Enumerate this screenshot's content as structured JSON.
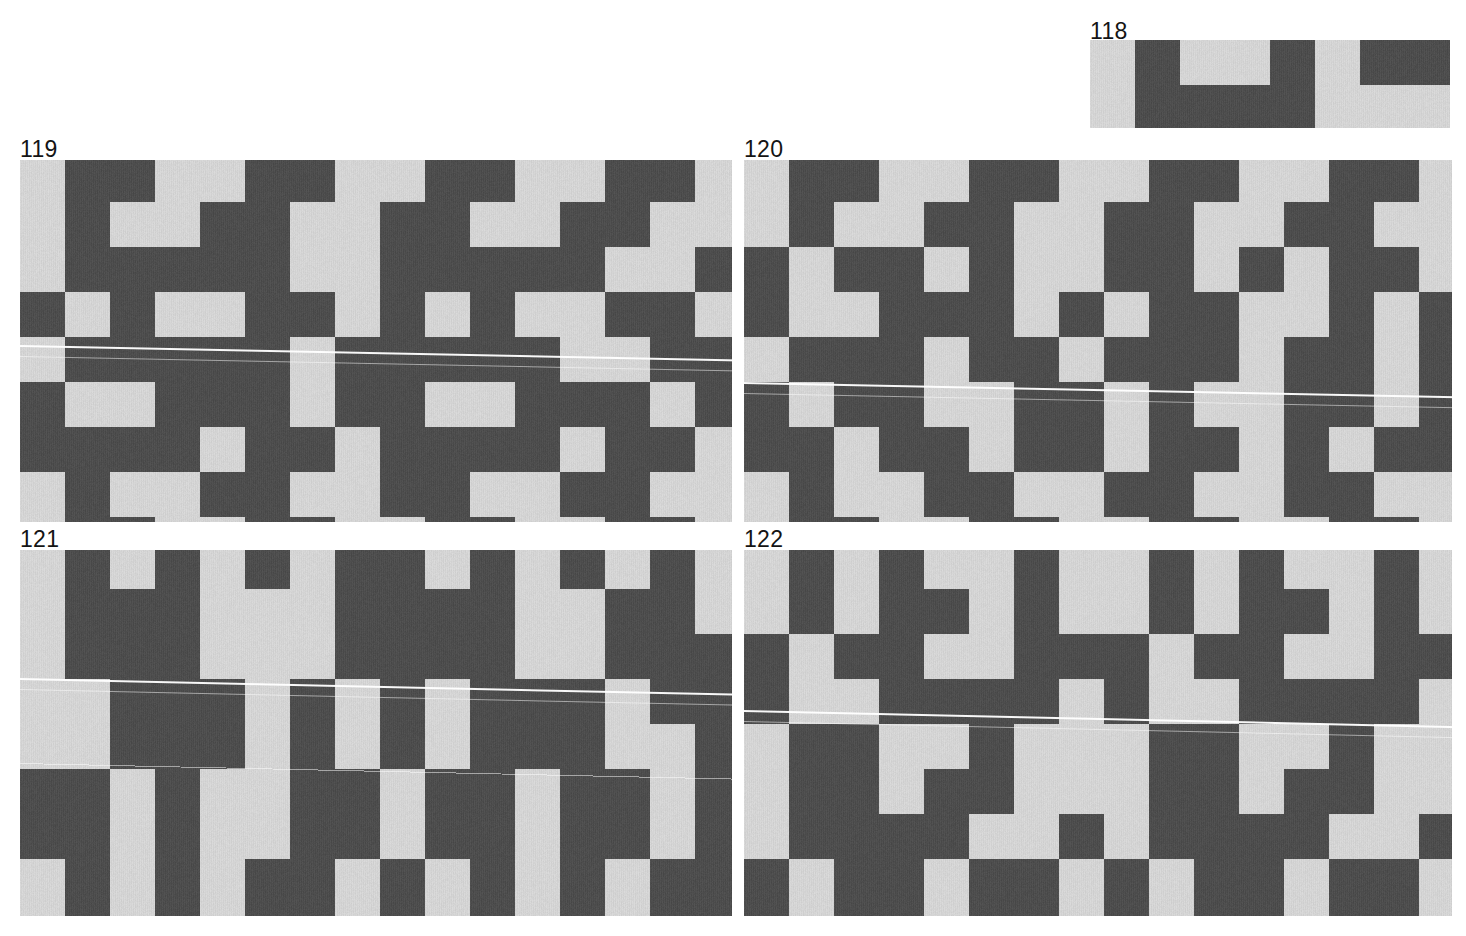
{
  "sheet": {
    "background_color": "#ffffff",
    "width": 1466,
    "height": 936,
    "cell_size": 45,
    "colors": {
      "light": "#d4d4d4",
      "dark": "#4d4d4d",
      "label": "#141414",
      "artifact_line": "#ffffff"
    }
  },
  "plates": [
    {
      "id": "plate-118",
      "number": "118",
      "label_x": 1090,
      "label_y": 20,
      "x": 1090,
      "y": 40,
      "width": 360,
      "height": 88,
      "cols": 8,
      "rows": 2,
      "offset_x": 0,
      "offset_y": 0,
      "scanlines": [],
      "grid": [
        [
          0,
          1,
          0,
          0,
          1,
          0,
          1,
          1
        ],
        [
          0,
          1,
          1,
          1,
          1,
          0,
          0,
          0
        ]
      ]
    },
    {
      "id": "plate-119",
      "number": "119",
      "label_x": 20,
      "label_y": 138,
      "x": 20,
      "y": 160,
      "width": 712,
      "height": 362,
      "cols": 16,
      "rows": 9,
      "offset_x": 0,
      "offset_y": -3,
      "scanlines": [
        {
          "y": 185,
          "angle": 1.15,
          "thin": false
        },
        {
          "y": 196,
          "angle": 1.15,
          "thin": true
        }
      ],
      "grid": [
        [
          0,
          1,
          1,
          0,
          0,
          1,
          1,
          0,
          0,
          1,
          1,
          0,
          0,
          1,
          1,
          0
        ],
        [
          0,
          1,
          0,
          0,
          1,
          1,
          0,
          0,
          1,
          1,
          0,
          0,
          1,
          1,
          0,
          0
        ],
        [
          0,
          1,
          1,
          1,
          1,
          1,
          0,
          0,
          1,
          1,
          1,
          1,
          1,
          0,
          0,
          1
        ],
        [
          1,
          0,
          1,
          0,
          0,
          1,
          1,
          0,
          1,
          0,
          1,
          0,
          0,
          1,
          1,
          0
        ],
        [
          0,
          1,
          1,
          1,
          1,
          1,
          0,
          1,
          1,
          1,
          1,
          1,
          0,
          0,
          1,
          1
        ],
        [
          1,
          0,
          0,
          1,
          1,
          1,
          0,
          1,
          1,
          0,
          0,
          1,
          1,
          1,
          0,
          1
        ],
        [
          1,
          1,
          1,
          1,
          0,
          1,
          1,
          0,
          1,
          1,
          1,
          1,
          0,
          1,
          1,
          0
        ],
        [
          0,
          1,
          0,
          0,
          1,
          1,
          0,
          0,
          1,
          1,
          0,
          0,
          1,
          1,
          0,
          0
        ],
        [
          0,
          1,
          1,
          0,
          0,
          1,
          1,
          0,
          0,
          1,
          1,
          0,
          0,
          1,
          1,
          0
        ]
      ]
    },
    {
      "id": "plate-120",
      "number": "120",
      "label_x": 744,
      "label_y": 138,
      "x": 744,
      "y": 160,
      "width": 708,
      "height": 362,
      "cols": 16,
      "rows": 9,
      "offset_x": 0,
      "offset_y": -3,
      "scanlines": [
        {
          "y": 222,
          "angle": 1.15,
          "thin": false
        },
        {
          "y": 233,
          "angle": 1.15,
          "thin": true
        }
      ],
      "grid": [
        [
          0,
          1,
          1,
          0,
          0,
          1,
          1,
          0,
          0,
          1,
          1,
          0,
          0,
          1,
          1,
          0
        ],
        [
          0,
          1,
          0,
          0,
          1,
          1,
          0,
          0,
          1,
          1,
          0,
          0,
          1,
          1,
          0,
          0
        ],
        [
          1,
          0,
          1,
          1,
          0,
          1,
          0,
          0,
          1,
          1,
          0,
          1,
          0,
          1,
          1,
          0
        ],
        [
          1,
          0,
          0,
          1,
          1,
          1,
          0,
          1,
          0,
          1,
          1,
          0,
          0,
          1,
          0,
          1
        ],
        [
          0,
          1,
          1,
          1,
          0,
          1,
          1,
          0,
          1,
          1,
          1,
          0,
          1,
          1,
          0,
          1
        ],
        [
          1,
          0,
          1,
          1,
          0,
          0,
          1,
          1,
          0,
          1,
          0,
          0,
          1,
          1,
          0,
          1
        ],
        [
          1,
          1,
          0,
          1,
          1,
          0,
          1,
          1,
          0,
          1,
          1,
          0,
          1,
          0,
          1,
          1
        ],
        [
          0,
          1,
          0,
          0,
          1,
          1,
          0,
          0,
          1,
          1,
          0,
          0,
          1,
          1,
          0,
          0
        ],
        [
          0,
          1,
          1,
          0,
          0,
          1,
          1,
          0,
          0,
          1,
          1,
          0,
          0,
          1,
          1,
          0
        ]
      ]
    },
    {
      "id": "plate-121",
      "number": "121",
      "label_x": 20,
      "label_y": 528,
      "x": 20,
      "y": 550,
      "width": 712,
      "height": 366,
      "cols": 16,
      "rows": 9,
      "offset_x": 0,
      "offset_y": -6,
      "scanlines": [
        {
          "y": 128,
          "angle": 1.25,
          "thin": false
        },
        {
          "y": 139,
          "angle": 1.25,
          "thin": true
        },
        {
          "y": 213,
          "angle": 1.25,
          "thin": true
        }
      ],
      "grid": [
        [
          0,
          1,
          0,
          1,
          0,
          1,
          0,
          1,
          1,
          0,
          1,
          0,
          1,
          0,
          1,
          0
        ],
        [
          0,
          1,
          1,
          1,
          0,
          0,
          0,
          1,
          1,
          1,
          1,
          0,
          0,
          1,
          1,
          0
        ],
        [
          0,
          1,
          1,
          1,
          0,
          0,
          0,
          1,
          1,
          1,
          1,
          0,
          0,
          1,
          1,
          1
        ],
        [
          0,
          0,
          1,
          1,
          1,
          0,
          1,
          0,
          1,
          0,
          1,
          1,
          1,
          0,
          1,
          1
        ],
        [
          0,
          0,
          1,
          1,
          1,
          0,
          1,
          0,
          1,
          0,
          1,
          1,
          1,
          0,
          0,
          1
        ],
        [
          1,
          1,
          0,
          1,
          0,
          0,
          1,
          1,
          0,
          1,
          1,
          0,
          1,
          1,
          0,
          1
        ],
        [
          1,
          1,
          0,
          1,
          0,
          0,
          1,
          1,
          0,
          1,
          1,
          0,
          1,
          1,
          0,
          1
        ],
        [
          0,
          1,
          0,
          1,
          0,
          1,
          1,
          0,
          1,
          0,
          1,
          0,
          1,
          0,
          1,
          1
        ],
        [
          0,
          1,
          0,
          1,
          0,
          1,
          1,
          0,
          1,
          0,
          1,
          0,
          1,
          0,
          1,
          1
        ]
      ]
    },
    {
      "id": "plate-122",
      "number": "122",
      "label_x": 744,
      "label_y": 528,
      "x": 744,
      "y": 550,
      "width": 708,
      "height": 366,
      "cols": 16,
      "rows": 9,
      "offset_x": 0,
      "offset_y": -6,
      "scanlines": [
        {
          "y": 160,
          "angle": 1.3,
          "thin": false
        },
        {
          "y": 171,
          "angle": 1.3,
          "thin": true
        }
      ],
      "grid": [
        [
          0,
          1,
          0,
          1,
          0,
          0,
          1,
          0,
          0,
          1,
          0,
          1,
          0,
          0,
          1,
          0
        ],
        [
          0,
          1,
          0,
          1,
          1,
          0,
          1,
          0,
          0,
          1,
          0,
          1,
          1,
          0,
          1,
          0
        ],
        [
          1,
          0,
          1,
          1,
          0,
          0,
          1,
          1,
          1,
          0,
          1,
          1,
          0,
          0,
          1,
          1
        ],
        [
          1,
          0,
          0,
          1,
          1,
          1,
          1,
          0,
          1,
          0,
          0,
          1,
          1,
          1,
          1,
          0
        ],
        [
          0,
          1,
          1,
          0,
          0,
          1,
          0,
          0,
          0,
          1,
          1,
          0,
          0,
          1,
          0,
          0
        ],
        [
          0,
          1,
          1,
          0,
          1,
          1,
          0,
          0,
          0,
          1,
          1,
          0,
          1,
          1,
          0,
          0
        ],
        [
          0,
          1,
          1,
          1,
          1,
          0,
          0,
          1,
          0,
          1,
          1,
          1,
          1,
          0,
          0,
          1
        ],
        [
          1,
          0,
          1,
          1,
          0,
          1,
          1,
          0,
          1,
          0,
          1,
          1,
          0,
          1,
          1,
          0
        ],
        [
          1,
          0,
          1,
          1,
          0,
          1,
          1,
          0,
          1,
          0,
          1,
          1,
          0,
          1,
          1,
          0
        ]
      ]
    }
  ]
}
